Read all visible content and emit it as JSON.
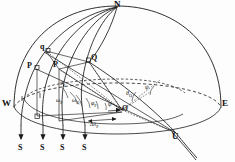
{
  "figure": {
    "type": "celestial-sphere-diagram",
    "title": "",
    "background_color": "#fdfdfd",
    "stroke_color": "#1a1a1a"
  },
  "cardinal_points": [
    {
      "name": "north",
      "label": "N",
      "x": 117,
      "y": 5
    },
    {
      "name": "west",
      "label": "W",
      "x": 6,
      "y": 104
    },
    {
      "name": "east",
      "label": "E",
      "x": 222,
      "y": 104
    },
    {
      "name": "zenith-u",
      "label": "U",
      "x": 174,
      "y": 133
    }
  ],
  "sphere_points": [
    {
      "name": "point-q-upper",
      "label": "q",
      "x": 43,
      "y": 50
    },
    {
      "name": "point-p-prime",
      "label": "P",
      "x": 31,
      "y": 68
    },
    {
      "name": "point-p",
      "label": "P",
      "x": 57,
      "y": 68
    },
    {
      "name": "point-q",
      "label": "Q",
      "x": 89,
      "y": 60
    },
    {
      "name": "origin",
      "label": "O",
      "x": 124,
      "y": 110
    }
  ],
  "angle_labels": [
    {
      "name": "theta-p",
      "glyph": "θ",
      "sub": "P",
      "x": 62,
      "y": 84
    },
    {
      "name": "omega-p",
      "glyph": "ω",
      "sub": "P",
      "x": 58,
      "y": 101
    },
    {
      "name": "omega-q",
      "glyph": "ω",
      "sub": "Q",
      "x": 74,
      "y": 101
    },
    {
      "name": "phi-p",
      "glyph": "φ",
      "sub": "P",
      "x": 93,
      "y": 104
    },
    {
      "name": "psi-lower",
      "glyph": "ψ",
      "sub": "",
      "x": 110,
      "y": 105
    },
    {
      "name": "theta-q",
      "glyph": "θ",
      "sub": "Q",
      "x": 128,
      "y": 94
    },
    {
      "name": "psi-upper",
      "glyph": "ψ",
      "sub": "",
      "x": 146,
      "y": 88
    }
  ],
  "delta_labels": [
    {
      "name": "delta-lambda-p",
      "glyph": "Δλ",
      "sub": "P",
      "x": 93,
      "y": 125
    }
  ],
  "south_arrows": [
    {
      "name": "south-arrow-1",
      "label": "S",
      "x": 20,
      "y": 148,
      "arrow_x": 21,
      "arrow_top": 122,
      "arrow_bottom": 140
    },
    {
      "name": "south-arrow-2",
      "label": "S",
      "x": 42,
      "y": 148,
      "arrow_x": 43,
      "arrow_top": 122,
      "arrow_bottom": 140
    },
    {
      "name": "south-arrow-3",
      "label": "S",
      "x": 62,
      "y": 148,
      "arrow_x": 63,
      "arrow_top": 122,
      "arrow_bottom": 140
    },
    {
      "name": "south-arrow-4",
      "label": "S",
      "x": 84,
      "y": 148,
      "arrow_x": 85,
      "arrow_top": 122,
      "arrow_bottom": 140
    }
  ],
  "legend": {
    "description": "Hemisphere with meridian arcs, horizon ellipse and angular parameters"
  }
}
